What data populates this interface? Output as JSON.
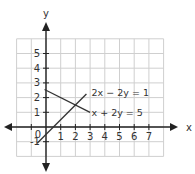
{
  "chart_data": {
    "type": "line",
    "title": "",
    "xlabel": "x",
    "ylabel": "y",
    "xlim": [
      -2,
      8
    ],
    "ylim": [
      -2,
      6
    ],
    "grid": true,
    "origin_label": "0",
    "x_ticks": [
      -1,
      1,
      2,
      3,
      4,
      5,
      6,
      7
    ],
    "x_tick_labels": [
      "",
      "1",
      "2",
      "3",
      "4",
      "5",
      "6",
      "7"
    ],
    "y_ticks": [
      -1,
      1,
      2,
      3,
      4,
      5
    ],
    "y_tick_labels": [
      "-1",
      "1",
      "2",
      "3",
      "4",
      "5"
    ],
    "series": [
      {
        "name": "x + 2y = 5",
        "label": "x + 2y = 5",
        "points": [
          [
            -0.1,
            2.55
          ],
          [
            3,
            1
          ]
        ]
      },
      {
        "name": "2x − 2y = 1",
        "label": "2x − 2y = 1",
        "points": [
          [
            -0.6,
            -1.1
          ],
          [
            2.75,
            2.25
          ]
        ]
      }
    ],
    "intersection": [
      2,
      1.5
    ],
    "annotations": [
      {
        "text": "2x − 2y = 1",
        "x": 3.1,
        "y": 2.35
      },
      {
        "text": "x + 2y = 5",
        "x": 3.1,
        "y": 1.0
      }
    ]
  },
  "colors": {
    "axis": "#222222",
    "grid": "#cfcfcf",
    "line": "#333333",
    "text": "#333333"
  }
}
